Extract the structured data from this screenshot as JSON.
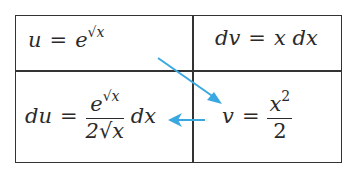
{
  "table": {
    "top_left": {
      "lhs": "u",
      "base": "e",
      "exp": "√x"
    },
    "top_right": {
      "lhs": "dv",
      "rhs": "x dx"
    },
    "bottom_left": {
      "lhs": "du",
      "num_base": "e",
      "num_exp": "√x",
      "den": "2√x",
      "tail": "dx"
    },
    "bottom_right": {
      "lhs": "v",
      "num": "x",
      "num_exp": "2",
      "den": "2"
    }
  },
  "arrows": {
    "color": "#3aa8e0"
  },
  "eq_sign": "="
}
